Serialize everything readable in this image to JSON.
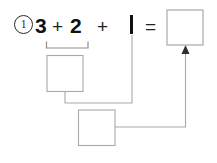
{
  "worksheet": {
    "problem_number": "①",
    "problem_number_plain": "1",
    "equation": {
      "term1": "3",
      "operator1": "+",
      "term2": "2",
      "operator2": "+",
      "term3": "1",
      "equals": "=",
      "answer_box_value": ""
    },
    "boxes": {
      "partial_sum_box_value": "",
      "second_partial_box_value": "",
      "final_answer_box_value": ""
    },
    "icons": {
      "arrow": "arrow-up-icon",
      "bracket": "grouping-bracket-icon"
    },
    "colors": {
      "ink": "#111111",
      "box_border": "#a8a8a8",
      "connector": "#a8a8a8",
      "arrow_fill": "#2f2f2f",
      "bracket": "#8e8e8e",
      "background": "#ffffff"
    }
  }
}
